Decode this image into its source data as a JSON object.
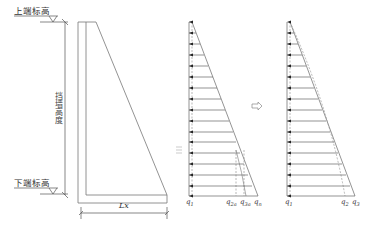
{
  "diagram": {
    "title": "",
    "left_section": {
      "top_elevation_label": "上端标高",
      "bottom_elevation_label": "下端标高",
      "height_label": "挡墙高度",
      "width_label": "Lx"
    },
    "middle_pressure_diagram": {
      "labels": {
        "q1": "q",
        "q1_sub": "1",
        "q2a": "q",
        "q2a_sub": "2a",
        "q3a": "q",
        "q3a_sub": "3a",
        "qn": "q",
        "qn_sub": "n"
      },
      "arrow_count": 13
    },
    "transition_arrow": "⇨",
    "right_pressure_diagram": {
      "labels": {
        "q1": "q",
        "q1_sub": "1",
        "q2": "q",
        "q2_sub": "2",
        "q3": "q",
        "q3_sub": "3"
      },
      "arrow_count": 13
    },
    "colors": {
      "line": "#555555",
      "light_line": "#999999",
      "text": "#333333"
    }
  }
}
